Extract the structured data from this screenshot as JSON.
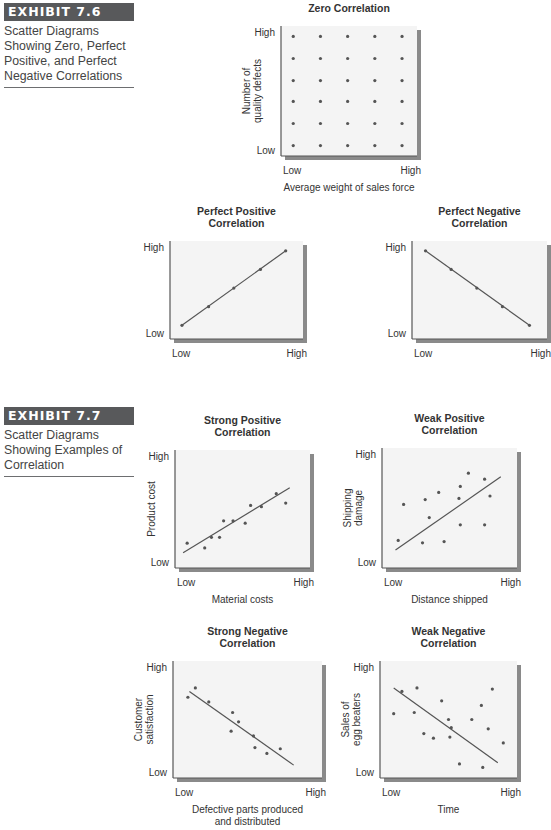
{
  "exhibits": [
    {
      "tag": "EXHIBIT 7.6",
      "caption_lines": [
        "Scatter Diagrams",
        "Showing Zero, Perfect",
        "Positive, and Perfect",
        "Negative Correlations"
      ]
    },
    {
      "tag": "EXHIBIT 7.7",
      "caption_lines": [
        "Scatter Diagrams",
        "Showing Examples of",
        "Correlation"
      ]
    }
  ],
  "colors": {
    "plot_bg": "#f4f4f4",
    "shadow": "#8a8a8a",
    "axis": "#555555",
    "dot": "#555555",
    "line": "#555555",
    "exhibit_tag_bg": "#58595b"
  },
  "chart_data": [
    {
      "id": "zero",
      "type": "scatter",
      "title": "Zero Correlation",
      "title_lines": [
        "Zero Correlation"
      ],
      "xlabel": "Average weight of sales force",
      "xlabel_lines": [
        "Average weight of sales force"
      ],
      "ylabel": "Number of quality defects",
      "ylabel_lines": [
        "Number of",
        "quality defects"
      ],
      "x_ticks": [
        "Low",
        "High"
      ],
      "y_ticks": [
        "Low",
        "High"
      ],
      "xlim": [
        0,
        1
      ],
      "ylim": [
        0,
        1
      ],
      "trendline": null,
      "grid": false,
      "box": {
        "x": 281,
        "y": 26,
        "w": 136,
        "h": 130
      },
      "points": [
        [
          0.09,
          0.92
        ],
        [
          0.29,
          0.92
        ],
        [
          0.49,
          0.92
        ],
        [
          0.69,
          0.92
        ],
        [
          0.89,
          0.92
        ],
        [
          0.09,
          0.75
        ],
        [
          0.29,
          0.75
        ],
        [
          0.49,
          0.75
        ],
        [
          0.69,
          0.75
        ],
        [
          0.89,
          0.75
        ],
        [
          0.09,
          0.58
        ],
        [
          0.29,
          0.58
        ],
        [
          0.49,
          0.58
        ],
        [
          0.69,
          0.58
        ],
        [
          0.89,
          0.58
        ],
        [
          0.09,
          0.42
        ],
        [
          0.29,
          0.42
        ],
        [
          0.49,
          0.42
        ],
        [
          0.69,
          0.42
        ],
        [
          0.89,
          0.42
        ],
        [
          0.09,
          0.25
        ],
        [
          0.29,
          0.25
        ],
        [
          0.49,
          0.25
        ],
        [
          0.69,
          0.25
        ],
        [
          0.89,
          0.25
        ],
        [
          0.09,
          0.08
        ],
        [
          0.29,
          0.08
        ],
        [
          0.49,
          0.08
        ],
        [
          0.69,
          0.08
        ],
        [
          0.89,
          0.08
        ]
      ]
    },
    {
      "id": "perfect-positive",
      "type": "scatter",
      "title": "Perfect Positive Correlation",
      "title_lines": [
        "Perfect Positive",
        "Correlation"
      ],
      "xlabel": "",
      "xlabel_lines": [],
      "ylabel": "",
      "ylabel_lines": [],
      "x_ticks": [
        "Low",
        "High"
      ],
      "y_ticks": [
        "Low",
        "High"
      ],
      "xlim": [
        0,
        1
      ],
      "ylim": [
        0,
        1
      ],
      "grid": false,
      "box": {
        "x": 170,
        "y": 241,
        "w": 133,
        "h": 98
      },
      "points": [
        [
          0.09,
          0.14
        ],
        [
          0.29,
          0.33
        ],
        [
          0.48,
          0.52
        ],
        [
          0.68,
          0.71
        ],
        [
          0.87,
          0.9
        ]
      ],
      "trendline": [
        [
          0.09,
          0.14
        ],
        [
          0.87,
          0.9
        ]
      ]
    },
    {
      "id": "perfect-negative",
      "type": "scatter",
      "title": "Perfect Negative Correlation",
      "title_lines": [
        "Perfect Negative",
        "Correlation"
      ],
      "xlabel": "",
      "xlabel_lines": [],
      "ylabel": "",
      "ylabel_lines": [],
      "x_ticks": [
        "Low",
        "High"
      ],
      "y_ticks": [
        "Low",
        "High"
      ],
      "xlim": [
        0,
        1
      ],
      "ylim": [
        0,
        1
      ],
      "grid": false,
      "box": {
        "x": 412,
        "y": 241,
        "w": 135,
        "h": 98
      },
      "points": [
        [
          0.1,
          0.9
        ],
        [
          0.29,
          0.71
        ],
        [
          0.48,
          0.52
        ],
        [
          0.67,
          0.33
        ],
        [
          0.87,
          0.14
        ]
      ],
      "trendline": [
        [
          0.1,
          0.9
        ],
        [
          0.87,
          0.14
        ]
      ]
    },
    {
      "id": "strong-positive",
      "type": "scatter",
      "title": "Strong Positive Correlation",
      "title_lines": [
        "Strong Positive",
        "Correlation"
      ],
      "xlabel": "Material costs",
      "xlabel_lines": [
        "Material costs"
      ],
      "ylabel": "Product cost",
      "ylabel_lines": [
        "Product cost"
      ],
      "x_ticks": [
        "Low",
        "High"
      ],
      "y_ticks": [
        "Low",
        "High"
      ],
      "xlim": [
        0,
        1
      ],
      "ylim": [
        0,
        1
      ],
      "grid": false,
      "box": {
        "x": 175,
        "y": 450,
        "w": 135,
        "h": 118
      },
      "points": [
        [
          0.09,
          0.21
        ],
        [
          0.22,
          0.17
        ],
        [
          0.27,
          0.26
        ],
        [
          0.33,
          0.26
        ],
        [
          0.36,
          0.4
        ],
        [
          0.43,
          0.4
        ],
        [
          0.52,
          0.38
        ],
        [
          0.56,
          0.53
        ],
        [
          0.64,
          0.52
        ],
        [
          0.75,
          0.63
        ],
        [
          0.82,
          0.55
        ]
      ],
      "trendline": [
        [
          0.06,
          0.13
        ],
        [
          0.85,
          0.68
        ]
      ]
    },
    {
      "id": "weak-positive",
      "type": "scatter",
      "title": "Weak Positive Correlation",
      "title_lines": [
        "Weak Positive",
        "Correlation"
      ],
      "xlabel": "Distance shipped",
      "xlabel_lines": [
        "Distance shipped"
      ],
      "ylabel": "Shipping damage",
      "ylabel_lines": [
        "Shipping",
        "damage"
      ],
      "x_ticks": [
        "Low",
        "High"
      ],
      "y_ticks": [
        "Low",
        "High"
      ],
      "xlim": [
        0,
        1
      ],
      "ylim": [
        0,
        1
      ],
      "grid": false,
      "box": {
        "x": 382,
        "y": 448,
        "w": 135,
        "h": 120
      },
      "points": [
        [
          0.12,
          0.23
        ],
        [
          0.16,
          0.53
        ],
        [
          0.3,
          0.21
        ],
        [
          0.32,
          0.57
        ],
        [
          0.35,
          0.42
        ],
        [
          0.42,
          0.63
        ],
        [
          0.46,
          0.22
        ],
        [
          0.57,
          0.58
        ],
        [
          0.58,
          0.68
        ],
        [
          0.58,
          0.36
        ],
        [
          0.64,
          0.79
        ],
        [
          0.76,
          0.74
        ],
        [
          0.76,
          0.36
        ],
        [
          0.8,
          0.6
        ]
      ],
      "trendline": [
        [
          0.1,
          0.15
        ],
        [
          0.88,
          0.76
        ]
      ]
    },
    {
      "id": "strong-negative",
      "type": "scatter",
      "title": "Strong Negative Correlation",
      "title_lines": [
        "Strong Negative",
        "Correlation"
      ],
      "xlabel": "Defective parts produced and distributed",
      "xlabel_lines": [
        "Defective parts produced",
        "and distributed"
      ],
      "ylabel": "Customer satisfaction",
      "ylabel_lines": [
        "Customer",
        "satisfaction"
      ],
      "x_ticks": [
        "Low",
        "High"
      ],
      "y_ticks": [
        "Low",
        "High"
      ],
      "xlim": [
        0,
        1
      ],
      "ylim": [
        0,
        1
      ],
      "grid": false,
      "box": {
        "x": 173,
        "y": 661,
        "w": 149,
        "h": 117
      },
      "points": [
        [
          0.1,
          0.69
        ],
        [
          0.15,
          0.77
        ],
        [
          0.24,
          0.65
        ],
        [
          0.4,
          0.56
        ],
        [
          0.44,
          0.48
        ],
        [
          0.39,
          0.4
        ],
        [
          0.54,
          0.36
        ],
        [
          0.55,
          0.26
        ],
        [
          0.63,
          0.21
        ],
        [
          0.72,
          0.25
        ]
      ],
      "trendline": [
        [
          0.11,
          0.74
        ],
        [
          0.81,
          0.11
        ]
      ]
    },
    {
      "id": "weak-negative",
      "type": "scatter",
      "title": "Weak Negative Correlation",
      "title_lines": [
        "Weak Negative",
        "Correlation"
      ],
      "xlabel": "Time",
      "xlabel_lines": [
        "Time"
      ],
      "ylabel": "Sales of egg beaters",
      "ylabel_lines": [
        "Sales of",
        "egg beaters"
      ],
      "x_ticks": [
        "Low",
        "High"
      ],
      "y_ticks": [
        "Low",
        "High"
      ],
      "xlim": [
        0,
        1
      ],
      "ylim": [
        0,
        1
      ],
      "grid": false,
      "box": {
        "x": 380,
        "y": 661,
        "w": 137,
        "h": 117
      },
      "points": [
        [
          0.1,
          0.55
        ],
        [
          0.16,
          0.74
        ],
        [
          0.27,
          0.77
        ],
        [
          0.25,
          0.56
        ],
        [
          0.45,
          0.66
        ],
        [
          0.32,
          0.38
        ],
        [
          0.39,
          0.34
        ],
        [
          0.5,
          0.5
        ],
        [
          0.51,
          0.35
        ],
        [
          0.52,
          0.43
        ],
        [
          0.67,
          0.5
        ],
        [
          0.74,
          0.62
        ],
        [
          0.79,
          0.42
        ],
        [
          0.82,
          0.76
        ],
        [
          0.9,
          0.3
        ],
        [
          0.58,
          0.12
        ],
        [
          0.75,
          0.09
        ]
      ],
      "trendline": [
        [
          0.1,
          0.77
        ],
        [
          0.86,
          0.13
        ]
      ]
    }
  ]
}
